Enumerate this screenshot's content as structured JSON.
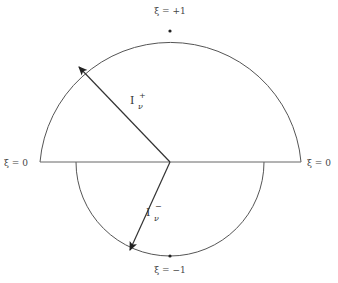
{
  "diagram": {
    "labels": {
      "top": "ξ = +1",
      "bottom": "ξ = −1",
      "left": "ξ = 0",
      "right": "ξ = 0"
    },
    "vectors": {
      "upper": {
        "base": "I",
        "sub": "ν",
        "sup": "+"
      },
      "lower": {
        "base": "I",
        "sub": "ν",
        "sup": "−"
      }
    },
    "colors": {
      "stroke": "#333333",
      "background": "#ffffff"
    }
  }
}
